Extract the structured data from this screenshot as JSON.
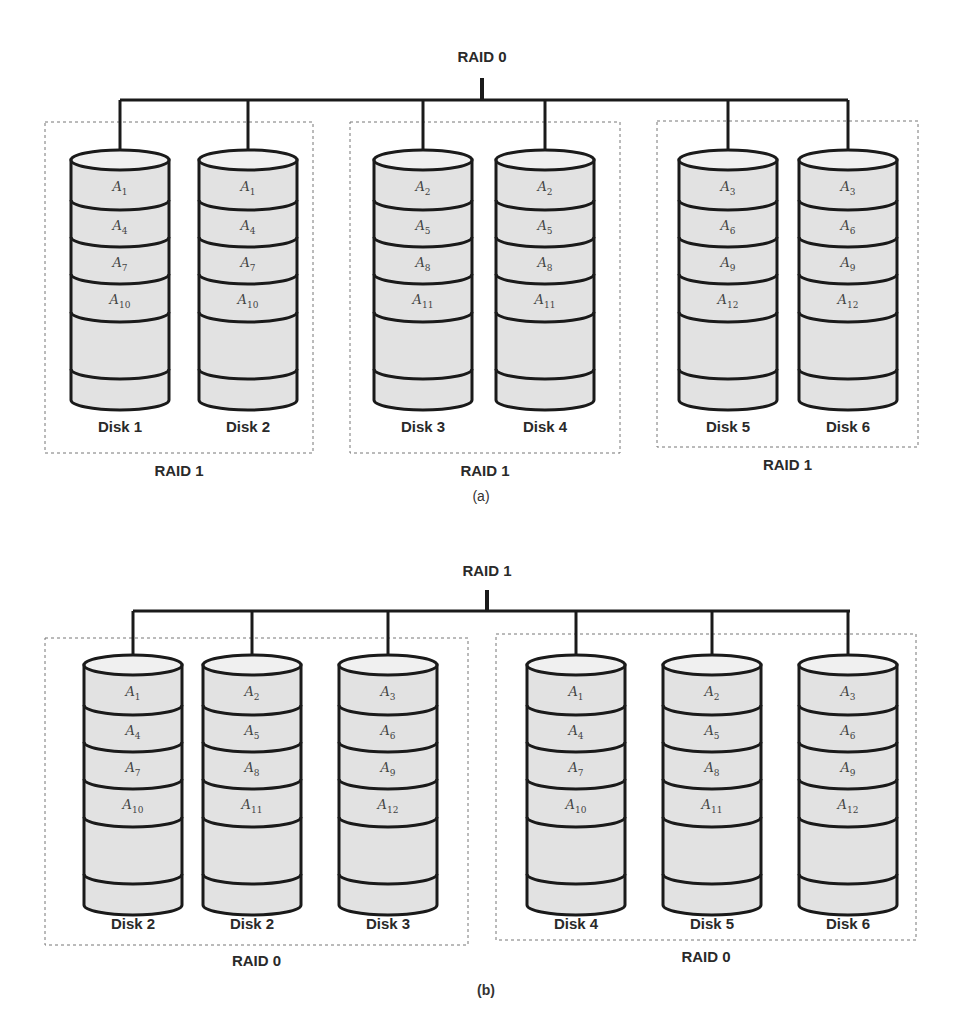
{
  "diagrams": [
    {
      "id": "a",
      "caption": "(a)",
      "top_label": "RAID 0",
      "groups": [
        {
          "label": "RAID 1",
          "disks": [
            {
              "name": "Disk 1",
              "blocks": [
                "1",
                "4",
                "7",
                "10"
              ]
            },
            {
              "name": "Disk 2",
              "blocks": [
                "1",
                "4",
                "7",
                "10"
              ]
            }
          ]
        },
        {
          "label": "RAID 1",
          "disks": [
            {
              "name": "Disk 3",
              "blocks": [
                "2",
                "5",
                "8",
                "11"
              ]
            },
            {
              "name": "Disk 4",
              "blocks": [
                "2",
                "5",
                "8",
                "11"
              ]
            }
          ]
        },
        {
          "label": "RAID 1",
          "disks": [
            {
              "name": "Disk 5",
              "blocks": [
                "3",
                "6",
                "9",
                "12"
              ]
            },
            {
              "name": "Disk 6",
              "blocks": [
                "3",
                "6",
                "9",
                "12"
              ]
            }
          ]
        }
      ]
    },
    {
      "id": "b",
      "caption": "(b)",
      "top_label": "RAID 1",
      "groups": [
        {
          "label": "RAID 0",
          "disks": [
            {
              "name": "Disk 2",
              "blocks": [
                "1",
                "4",
                "7",
                "10"
              ]
            },
            {
              "name": "Disk 2",
              "blocks": [
                "2",
                "5",
                "8",
                "11"
              ]
            },
            {
              "name": "Disk 3",
              "blocks": [
                "3",
                "6",
                "9",
                "12"
              ]
            }
          ]
        },
        {
          "label": "RAID 0",
          "disks": [
            {
              "name": "Disk 4",
              "blocks": [
                "1",
                "4",
                "7",
                "10"
              ]
            },
            {
              "name": "Disk 5",
              "blocks": [
                "2",
                "5",
                "8",
                "11"
              ]
            },
            {
              "name": "Disk 6",
              "blocks": [
                "3",
                "6",
                "9",
                "12"
              ]
            }
          ]
        }
      ]
    }
  ],
  "block_prefix": "A",
  "colors": {
    "stroke": "#1a1a1a",
    "disk_fill": "#e2e2e2",
    "disk_top_fill": "#f0f0f0",
    "group_border": "#777777"
  }
}
